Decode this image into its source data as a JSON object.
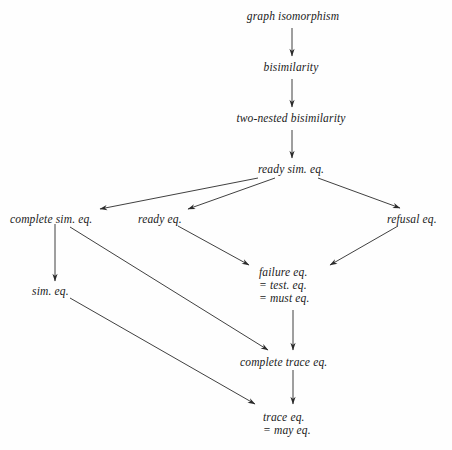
{
  "diagram": {
    "background_color": "#fefefe",
    "edge_color": "#2a2a2a",
    "text_color": "#1a1a1a",
    "nodes": [
      {
        "id": "graph_isomorphism",
        "lines": [
          "graph isomorphism"
        ],
        "x": 293,
        "y": 10,
        "align": "center"
      },
      {
        "id": "bisimilarity",
        "lines": [
          "bisimilarity"
        ],
        "x": 291,
        "y": 61,
        "align": "center"
      },
      {
        "id": "two_nested_bisimilarity",
        "lines": [
          "two-nested bisimilarity"
        ],
        "x": 291,
        "y": 112,
        "align": "center"
      },
      {
        "id": "ready_sim_eq",
        "lines": [
          "ready sim. eq."
        ],
        "x": 291,
        "y": 163,
        "align": "center"
      },
      {
        "id": "complete_sim_eq",
        "lines": [
          "complete sim. eq."
        ],
        "x": 10,
        "y": 213,
        "align": "left"
      },
      {
        "id": "ready_eq",
        "lines": [
          "ready eq."
        ],
        "x": 138,
        "y": 213,
        "align": "left"
      },
      {
        "id": "refusal_eq",
        "lines": [
          "refusal eq."
        ],
        "x": 387,
        "y": 213,
        "align": "left"
      },
      {
        "id": "failure_eq",
        "lines": [
          "failure eq.",
          "= test. eq.",
          "= must eq."
        ],
        "x": 259,
        "y": 266,
        "align": "left"
      },
      {
        "id": "sim_eq",
        "lines": [
          "sim. eq."
        ],
        "x": 32,
        "y": 285,
        "align": "left"
      },
      {
        "id": "complete_trace_eq",
        "lines": [
          "complete trace eq."
        ],
        "x": 240,
        "y": 356,
        "align": "left"
      },
      {
        "id": "trace_eq",
        "lines": [
          "trace eq.",
          "= may eq."
        ],
        "x": 263,
        "y": 411,
        "align": "left"
      }
    ],
    "edges": [
      {
        "id": "edge-graph-isomorphism-to-bisimilarity",
        "from": "graph_isomorphism",
        "to": "bisimilarity",
        "x1": 292,
        "y1": 28,
        "x2": 292,
        "y2": 56
      },
      {
        "id": "edge-bisimilarity-to-two-nested",
        "from": "bisimilarity",
        "to": "two_nested_bisimilarity",
        "x1": 292,
        "y1": 79,
        "x2": 292,
        "y2": 107
      },
      {
        "id": "edge-two-nested-to-ready-sim",
        "from": "two_nested_bisimilarity",
        "to": "ready_sim_eq",
        "x1": 292,
        "y1": 130,
        "x2": 292,
        "y2": 158
      },
      {
        "id": "edge-ready-sim-to-complete-sim",
        "from": "ready_sim_eq",
        "to": "complete_sim_eq",
        "x1": 258,
        "y1": 178,
        "x2": 100,
        "y2": 209
      },
      {
        "id": "edge-ready-sim-to-ready-eq",
        "from": "ready_sim_eq",
        "to": "ready_eq",
        "x1": 275,
        "y1": 178,
        "x2": 188,
        "y2": 209
      },
      {
        "id": "edge-ready-sim-to-refusal-eq",
        "from": "ready_sim_eq",
        "to": "refusal_eq",
        "x1": 318,
        "y1": 178,
        "x2": 400,
        "y2": 208
      },
      {
        "id": "edge-complete-sim-to-sim-eq",
        "from": "complete_sim_eq",
        "to": "sim_eq",
        "x1": 55,
        "y1": 224,
        "x2": 55,
        "y2": 281
      },
      {
        "id": "edge-ready-eq-to-failure-eq",
        "from": "ready_eq",
        "to": "failure_eq",
        "x1": 178,
        "y1": 226,
        "x2": 249,
        "y2": 265
      },
      {
        "id": "edge-refusal-eq-to-failure-eq",
        "from": "refusal_eq",
        "to": "failure_eq",
        "x1": 398,
        "y1": 226,
        "x2": 330,
        "y2": 265
      },
      {
        "id": "edge-complete-sim-to-complete-trace",
        "from": "complete_sim_eq",
        "to": "complete_trace_eq",
        "x1": 70,
        "y1": 227,
        "x2": 268,
        "y2": 350
      },
      {
        "id": "edge-failure-eq-to-complete-trace",
        "from": "failure_eq",
        "to": "complete_trace_eq",
        "x1": 293,
        "y1": 310,
        "x2": 293,
        "y2": 350
      },
      {
        "id": "edge-sim-eq-to-trace-eq",
        "from": "sim_eq",
        "to": "trace_eq",
        "x1": 70,
        "y1": 298,
        "x2": 255,
        "y2": 404
      },
      {
        "id": "edge-complete-trace-to-trace-eq",
        "from": "complete_trace_eq",
        "to": "trace_eq",
        "x1": 293,
        "y1": 370,
        "x2": 293,
        "y2": 404
      }
    ]
  }
}
